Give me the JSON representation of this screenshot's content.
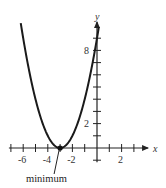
{
  "chart_data": {
    "type": "line",
    "title": "",
    "xlabel": "x",
    "ylabel": "y",
    "function": "y = (x + 3)^2",
    "x_ticks": [
      -7,
      -6,
      -5,
      -4,
      -3,
      -2,
      -1,
      1,
      2,
      3
    ],
    "x_tick_labels": [
      "-6",
      "-4",
      "-2",
      "2"
    ],
    "x_tick_label_values": [
      -6,
      -4,
      -2,
      2
    ],
    "y_ticks": [
      -1,
      1,
      2,
      3,
      4,
      5,
      6,
      7,
      8,
      9
    ],
    "y_tick_labels": [
      "2",
      "8"
    ],
    "y_tick_label_values": [
      2,
      8
    ],
    "xlim": [
      -7,
      3.5
    ],
    "ylim": [
      -1,
      10
    ],
    "grid": false,
    "series": [
      {
        "name": "parabola",
        "x": [
          -6.1,
          -5.5,
          -5,
          -4.5,
          -4,
          -3.5,
          -3,
          -2.5,
          -2,
          -1.5,
          -1,
          -0.5,
          0,
          0.1
        ],
        "values": [
          9.61,
          6.25,
          4,
          2.25,
          1,
          0.25,
          0,
          0.25,
          1,
          2.25,
          4,
          6.25,
          9,
          9.61
        ]
      }
    ],
    "annotations": [
      {
        "text": "minimum",
        "point": [
          -3,
          0
        ]
      }
    ]
  }
}
